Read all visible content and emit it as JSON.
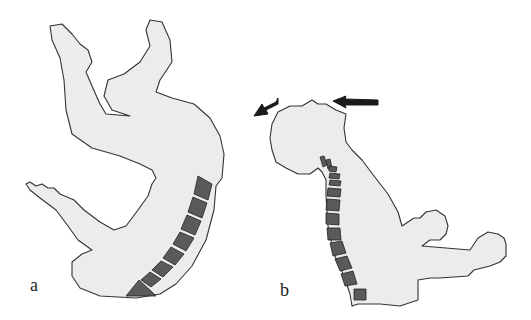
{
  "figure": {
    "panels": [
      {
        "id": "a",
        "label": "a",
        "description": "Curled body outline with curved spine of vertebrae and arrowhead at lower end",
        "vertebrae_count": 10
      },
      {
        "id": "b",
        "label": "b",
        "description": "Head and upper torso with extended cervical and thoracic spine; arrows indicating backward head motion",
        "vertebrae_count": 13,
        "arrows": [
          "curved-arrow-left-down",
          "straight-arrow-left"
        ]
      }
    ],
    "colors": {
      "body_fill": "#ececec",
      "outline": "#333333",
      "vertebra": "#5a5a5a",
      "arrow": "#1a1a1a"
    }
  }
}
